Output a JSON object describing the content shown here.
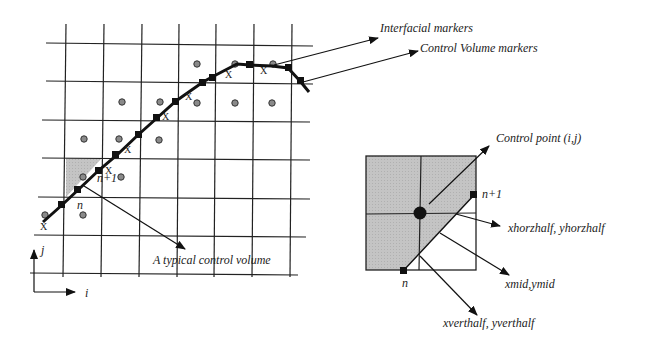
{
  "diagram": {
    "left_panel": {
      "labels": {
        "interfacial_markers": "Interfacial markers",
        "control_volume_markers": "Control Volume markers",
        "typical_control_volume": "A typical control volume",
        "marker_n": "n",
        "marker_n1": "n+1",
        "axis_i": "i",
        "axis_j": "j",
        "x_mark": "X"
      }
    },
    "right_panel": {
      "labels": {
        "control_point": "Control point (i,j)",
        "marker_n1": "n+1",
        "marker_n": "n",
        "horz_half": "xhorzhalf, yhorzhalf",
        "mid": "xmid,ymid",
        "vert_half": "xverthalf, yverthalf"
      }
    },
    "colors": {
      "line": "#1a1a1a",
      "shade": "#c8c8c8",
      "dot_fill": "#8a8a8a",
      "grid": "#2a2a2a"
    }
  }
}
